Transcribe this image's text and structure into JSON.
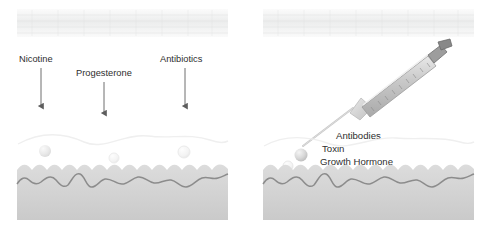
{
  "figure": {
    "panels": [
      {
        "id": "left",
        "name": "passive-diffusion-panel",
        "route": "transdermal",
        "substances": [
          {
            "label": "Nicotine",
            "arrow": "down-arrow-nicotine",
            "x": 41,
            "text_x": 19,
            "text_y": 62,
            "arrow_y_start": 68,
            "arrow_y_end": 108
          },
          {
            "label": "Progesterone",
            "arrow": "down-arrow-progesterone",
            "x": 104,
            "text_x": 76,
            "text_y": 76,
            "arrow_y_start": 82,
            "arrow_y_end": 114
          },
          {
            "label": "Antibiotics",
            "arrow": "down-arrow-antibiotics",
            "x": 185,
            "text_x": 160,
            "text_y": 62,
            "arrow_y_start": 68,
            "arrow_y_end": 108
          }
        ],
        "molecules": [
          {
            "cx": 45,
            "cy": 151,
            "r": 6
          },
          {
            "cx": 114,
            "cy": 158,
            "r": 5
          },
          {
            "cx": 184,
            "cy": 152,
            "r": 6
          }
        ]
      },
      {
        "id": "right",
        "name": "injection-panel",
        "route": "injection",
        "device": "syringe",
        "substances": [
          {
            "label": "Antibodies",
            "text_x": 336,
            "text_y": 139
          },
          {
            "label": "Toxin",
            "text_x": 322,
            "text_y": 152
          },
          {
            "label": "Growth Hormone",
            "text_x": 320,
            "text_y": 164
          },
          {
            "label": "Insulin",
            "text_x": 310,
            "text_y": 177
          }
        ],
        "molecules": [
          {
            "cx": 301,
            "cy": 155,
            "r": 6.5
          },
          {
            "cx": 288,
            "cy": 166,
            "r": 5
          },
          {
            "cx": 294,
            "cy": 175,
            "r": 4.5
          },
          {
            "cx": 281,
            "cy": 178,
            "r": 4
          }
        ]
      }
    ],
    "colors": {
      "tissue_fill": "#d2d2d2",
      "tissue_outline": "#8c8c8c",
      "membrane_band": "#f2f2f2",
      "arrow": "#6e6e6e",
      "syringe_body": "#cfcfcf",
      "syringe_outline": "#9a9a9a",
      "needle": "#b9b9b9",
      "text": "#2e2e2e"
    }
  }
}
